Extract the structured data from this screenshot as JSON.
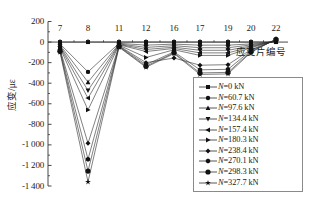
{
  "chart_data": {
    "type": "line",
    "title": "",
    "xlabel": "应变片编号",
    "ylabel": "应变/με",
    "categories": [
      "7",
      "8",
      "11",
      "12",
      "16",
      "17",
      "19",
      "20",
      "22"
    ],
    "xtick_labels": [
      "7",
      "8",
      "11",
      "12",
      "16",
      "17",
      "19",
      "20",
      "22"
    ],
    "ytick_labels": [
      "200",
      "0",
      "-200",
      "-400",
      "-600",
      "-800",
      "-1 000",
      "-1 200",
      "-1 400"
    ],
    "ytick_values": [
      200,
      0,
      -200,
      -400,
      -600,
      -800,
      -1000,
      -1200,
      -1400
    ],
    "ylim": [
      -1450,
      200
    ],
    "grid": false,
    "legend_position": "lower-right-inside",
    "series": [
      {
        "name": "N=0 kN",
        "label_prefix": "N",
        "load_kN": 0,
        "marker": "square",
        "values": [
          0,
          0,
          0,
          0,
          0,
          0,
          0,
          0,
          0
        ]
      },
      {
        "name": "N=60.7 kN",
        "label_prefix": "N",
        "load_kN": 60.7,
        "marker": "circle",
        "values": [
          -18,
          -290,
          -12,
          -30,
          -20,
          -30,
          -30,
          -18,
          5
        ]
      },
      {
        "name": "N=97.6 kN",
        "label_prefix": "N",
        "load_kN": 97.6,
        "marker": "triangle-up",
        "values": [
          -28,
          -390,
          -18,
          -52,
          -35,
          -55,
          -55,
          -28,
          8
        ]
      },
      {
        "name": "N=134.4 kN",
        "label_prefix": "N",
        "load_kN": 134.4,
        "marker": "triangle-down",
        "values": [
          -38,
          -470,
          -22,
          -72,
          -50,
          -80,
          -80,
          -38,
          10
        ]
      },
      {
        "name": "N=157.4 kN",
        "label_prefix": "N",
        "load_kN": 157.4,
        "marker": "triangle-left",
        "values": [
          -46,
          -545,
          -26,
          -92,
          -62,
          -105,
          -105,
          -46,
          12
        ]
      },
      {
        "name": "N=180.3 kN",
        "label_prefix": "N",
        "load_kN": 180.3,
        "marker": "triangle-right",
        "values": [
          -55,
          -660,
          -30,
          -150,
          -75,
          -130,
          -130,
          -55,
          14
        ]
      },
      {
        "name": "N=238.4 kN",
        "label_prefix": "N",
        "load_kN": 238.4,
        "marker": "diamond",
        "values": [
          -70,
          -985,
          -36,
          -200,
          -155,
          -225,
          -220,
          -72,
          18
        ]
      },
      {
        "name": "N=270.1 kN",
        "label_prefix": "N",
        "load_kN": 270.1,
        "marker": "hexagon",
        "values": [
          -80,
          -1140,
          -40,
          -220,
          -95,
          -270,
          -265,
          -82,
          22
        ]
      },
      {
        "name": "N=298.3 kN",
        "label_prefix": "N",
        "load_kN": 298.3,
        "marker": "circle-large",
        "values": [
          -90,
          -1255,
          -45,
          -235,
          -105,
          -300,
          -295,
          -92,
          26
        ]
      },
      {
        "name": "N=327.7 kN",
        "label_prefix": "N",
        "load_kN": 327.7,
        "marker": "star",
        "values": [
          -100,
          -1360,
          -50,
          -245,
          -112,
          -315,
          -310,
          -100,
          30
        ]
      }
    ]
  },
  "axes": {
    "y_axis_label": "应变/με",
    "x_axis_label": "应变片编号"
  }
}
